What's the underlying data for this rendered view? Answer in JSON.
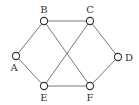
{
  "graph": {
    "nodes": [
      {
        "id": "A",
        "label": "A",
        "x": 16,
        "y": 56,
        "lx": 14,
        "ly": 71
      },
      {
        "id": "B",
        "label": "B",
        "x": 44,
        "y": 21,
        "lx": 44,
        "ly": 13
      },
      {
        "id": "C",
        "label": "C",
        "x": 90,
        "y": 21,
        "lx": 90,
        "ly": 13
      },
      {
        "id": "D",
        "label": "D",
        "x": 118,
        "y": 57,
        "lx": 129,
        "ly": 61
      },
      {
        "id": "E",
        "label": "E",
        "x": 44,
        "y": 86,
        "lx": 44,
        "ly": 101
      },
      {
        "id": "F",
        "label": "F",
        "x": 90,
        "y": 86,
        "lx": 90,
        "ly": 101
      }
    ],
    "edges": [
      [
        "A",
        "B"
      ],
      [
        "A",
        "E"
      ],
      [
        "B",
        "C"
      ],
      [
        "B",
        "F"
      ],
      [
        "C",
        "E"
      ],
      [
        "C",
        "D"
      ],
      [
        "D",
        "F"
      ],
      [
        "E",
        "F"
      ]
    ]
  }
}
